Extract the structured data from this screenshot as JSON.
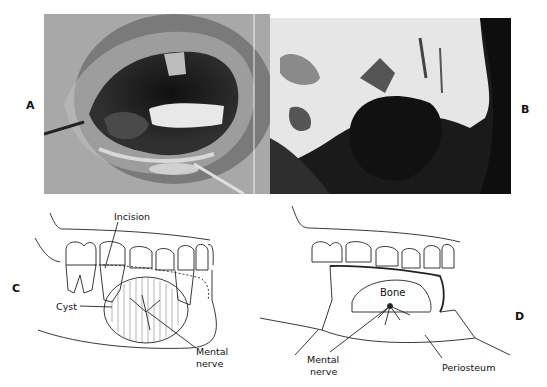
{
  "figure": {
    "panels": [
      {
        "id": "A",
        "label": "A",
        "type": "clinical-photograph",
        "description": "Intraoral view, mandibular swelling with retractor and mirror"
      },
      {
        "id": "B",
        "label": "B",
        "type": "radiograph",
        "description": "Radiolucent cystic lesion in mandible"
      },
      {
        "id": "C",
        "label": "C",
        "type": "illustration",
        "annotations": [
          "Incision",
          "Cyst",
          "Mental",
          "nerve"
        ]
      },
      {
        "id": "D",
        "label": "D",
        "type": "illustration",
        "annotations": [
          "Bone",
          "Mental",
          "nerve",
          "Periosteum"
        ]
      }
    ],
    "labels": {
      "A": "A",
      "B": "B",
      "C": "C",
      "D": "D"
    },
    "panel_c": {
      "incision": "Incision",
      "cyst": "Cyst",
      "mental": "Mental",
      "nerve": "nerve"
    },
    "panel_d": {
      "bone": "Bone",
      "mental": "Mental",
      "nerve": "nerve",
      "periosteum": "Periosteum"
    }
  }
}
